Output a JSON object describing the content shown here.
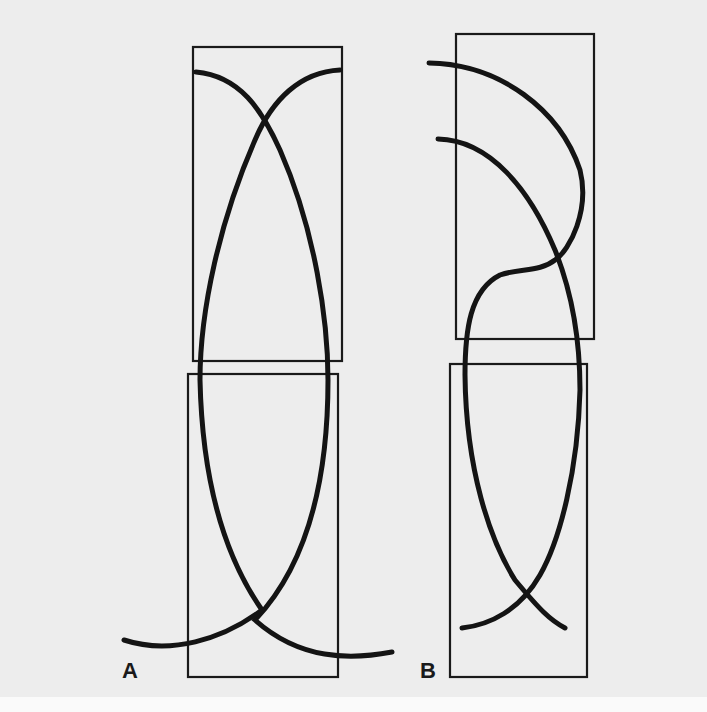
{
  "diagram": {
    "background_color": "#ededed",
    "stroke_color": "#141414",
    "panels": [
      {
        "label": "A",
        "description": "Two stacked rectangles with two crossing arcs forming an elongated lens; arcs cross near top and bottom",
        "boxes": [
          {
            "x": 193,
            "y": 47,
            "w": 149,
            "h": 314
          },
          {
            "x": 188,
            "y": 374,
            "w": 150,
            "h": 303
          }
        ]
      },
      {
        "label": "B",
        "description": "Two stacked rectangles; upper curves form an S-bend crossing, lower curves cross near bottom",
        "boxes": [
          {
            "x": 456,
            "y": 34,
            "w": 138,
            "h": 305
          },
          {
            "x": 450,
            "y": 364,
            "w": 137,
            "h": 313
          }
        ]
      }
    ]
  }
}
